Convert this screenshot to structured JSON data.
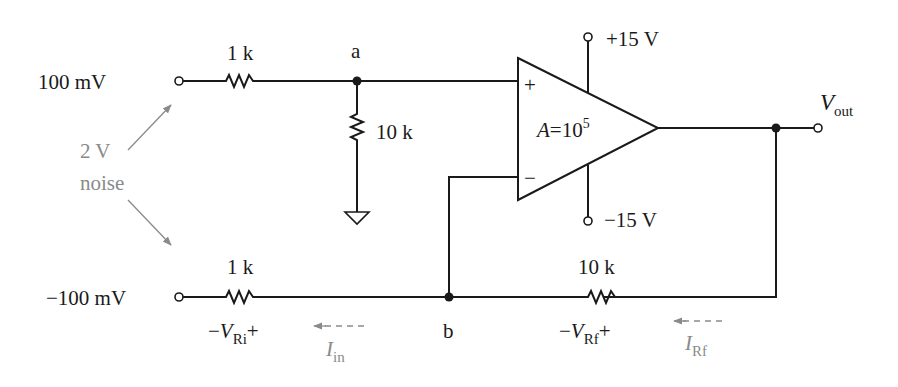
{
  "diagram": {
    "type": "op-amp differential amplifier circuit",
    "inputs": {
      "top": {
        "label": "100 mV",
        "resistor": "1 k"
      },
      "bottom": {
        "label": "−100 mV",
        "resistor": "1 k"
      }
    },
    "noise": {
      "line1": "2 V",
      "line2": "noise"
    },
    "nodes": {
      "a": "a",
      "b": "b"
    },
    "shunt_resistor": "10 k",
    "feedback_resistor": "10 k",
    "opamp": {
      "gain_prefix": "A",
      "gain_eq": "=10",
      "gain_exp": "5",
      "plus_sign": "+",
      "minus_sign": "−",
      "supply_pos": "+15 V",
      "supply_neg": "−15 V"
    },
    "output": {
      "label_main": "V",
      "label_sub": "out"
    },
    "voltage_labels": {
      "ri": {
        "minus": "−",
        "v": "V",
        "sub": "Ri",
        "plus": "+"
      },
      "rf": {
        "minus": "−",
        "v": "V",
        "sub": "Rf",
        "plus": "+"
      }
    },
    "current_labels": {
      "in": {
        "i": "I",
        "sub": "in"
      },
      "rf": {
        "i": "I",
        "sub": "Rf"
      }
    },
    "colors": {
      "ink": "#1a1a1a",
      "annotation": "#8a8a8a",
      "background": "#ffffff"
    }
  }
}
